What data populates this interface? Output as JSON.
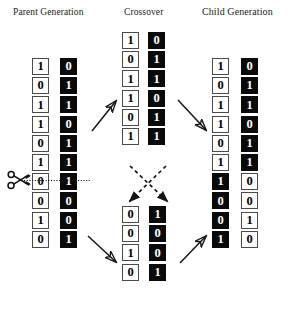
{
  "headers": {
    "parent": "Parent Generation",
    "crossover": "Crossover",
    "child": "Child Generation"
  },
  "colors": {
    "white_cell_bg": "#ffffff",
    "white_cell_text": "#000000",
    "white_cell_border": "#4a4a4a",
    "black_cell_bg": "#0a0a0a",
    "black_cell_text": "#ffffff",
    "ink": "#111111",
    "page_bg": "#ffffff"
  },
  "chart_data": {
    "type": "diagram",
    "crossover_point": 6,
    "chromosome_length": 10,
    "columns": [
      {
        "id": "parent-a",
        "group": "Parent Generation",
        "style": "white",
        "bits": [
          "1",
          "0",
          "1",
          "1",
          "0",
          "1",
          "0",
          "0",
          "1",
          "0"
        ]
      },
      {
        "id": "parent-b",
        "group": "Parent Generation",
        "style": "black",
        "bits": [
          "0",
          "1",
          "1",
          "0",
          "1",
          "1",
          "1",
          "0",
          "0",
          "1"
        ]
      },
      {
        "id": "crossover-top-a",
        "group": "Crossover",
        "style": "white",
        "bits": [
          "1",
          "0",
          "1",
          "1",
          "0",
          "1"
        ]
      },
      {
        "id": "crossover-top-b",
        "group": "Crossover",
        "style": "black",
        "bits": [
          "0",
          "1",
          "1",
          "0",
          "1",
          "1"
        ]
      },
      {
        "id": "crossover-bottom-a",
        "group": "Crossover",
        "style": "white",
        "bits": [
          "0",
          "0",
          "1",
          "0"
        ]
      },
      {
        "id": "crossover-bottom-b",
        "group": "Crossover",
        "style": "black",
        "bits": [
          "1",
          "0",
          "0",
          "1"
        ]
      },
      {
        "id": "child-a",
        "group": "Child Generation",
        "styles": [
          "white",
          "white",
          "white",
          "white",
          "white",
          "white",
          "black",
          "black",
          "black",
          "black"
        ],
        "bits": [
          "1",
          "0",
          "1",
          "1",
          "0",
          "1",
          "1",
          "0",
          "0",
          "1"
        ]
      },
      {
        "id": "child-b",
        "group": "Child Generation",
        "styles": [
          "black",
          "black",
          "black",
          "black",
          "black",
          "black",
          "white",
          "white",
          "white",
          "white"
        ],
        "bits": [
          "0",
          "1",
          "1",
          "0",
          "1",
          "1",
          "0",
          "0",
          "1",
          "0"
        ]
      }
    ]
  },
  "annotations": {
    "scissors_icon": "scissors-icon",
    "cut_line": "dotted-cut-line",
    "arrows": [
      {
        "name": "parent-top-to-crossover-top",
        "style": "solid"
      },
      {
        "name": "parent-bottom-to-crossover-bottom",
        "style": "solid"
      },
      {
        "name": "crossover-top-left-to-bottom-right",
        "style": "dashed"
      },
      {
        "name": "crossover-top-right-to-bottom-left",
        "style": "dashed"
      },
      {
        "name": "crossover-top-to-child-top",
        "style": "solid"
      },
      {
        "name": "crossover-bottom-to-child-bottom",
        "style": "solid"
      }
    ]
  }
}
